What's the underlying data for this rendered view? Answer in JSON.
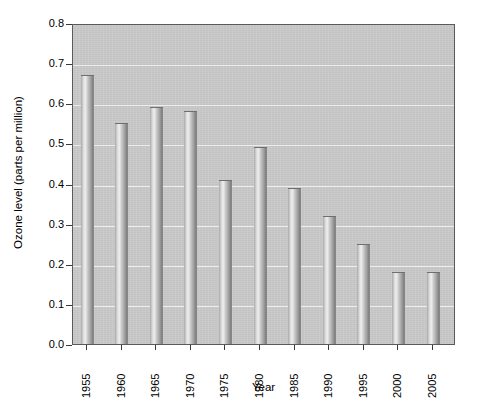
{
  "chart_data": {
    "type": "bar",
    "title": "",
    "xlabel": "Year",
    "ylabel": "Ozone level (parts per million)",
    "categories": [
      "1955",
      "1960",
      "1965",
      "1970",
      "1975",
      "1980",
      "1985",
      "1990",
      "1995",
      "2000",
      "2005"
    ],
    "values": [
      0.67,
      0.55,
      0.59,
      0.58,
      0.41,
      0.49,
      0.39,
      0.32,
      0.25,
      0.18,
      0.18
    ],
    "ylim": [
      0.0,
      0.8
    ],
    "yticks": [
      "0.0",
      "0.1",
      "0.2",
      "0.3",
      "0.4",
      "0.5",
      "0.6",
      "0.7",
      "0.8"
    ],
    "ytick_values": [
      0.0,
      0.1,
      0.2,
      0.3,
      0.4,
      0.5,
      0.6,
      0.7,
      0.8
    ],
    "grid": true,
    "legend": false,
    "legend_position": "none",
    "series": [
      {
        "name": "Ozone level",
        "values": [
          0.67,
          0.55,
          0.59,
          0.58,
          0.41,
          0.49,
          0.39,
          0.32,
          0.25,
          0.18,
          0.18
        ]
      }
    ],
    "colors": {
      "plot_background": "#c9c9c9",
      "bar_fill": "#b4b4b4",
      "gridline": "#ededed",
      "axis": "#5a5a5a",
      "text": "#000000",
      "figure_background": "#ffffff"
    }
  }
}
